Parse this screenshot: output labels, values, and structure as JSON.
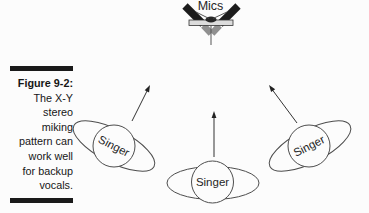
{
  "figure": {
    "caption": {
      "label": "Figure 9-2:",
      "lines": [
        "The X-Y",
        "stereo",
        "miking",
        "pattern can",
        "work well",
        "for backup",
        "vocals."
      ]
    },
    "diagram": {
      "mics_label": "Mics",
      "singers": [
        {
          "label": "Singer",
          "position": "left"
        },
        {
          "label": "Singer",
          "position": "center"
        },
        {
          "label": "Singer",
          "position": "right"
        }
      ]
    },
    "colors": {
      "background": "#fcfcfc",
      "ink": "#1a1a1a",
      "outline": "#4d4d4d",
      "arrow": "#333333",
      "mic_body": "#1c1c1c",
      "mic_capsule": "#909090",
      "stereo_bar": "#dcdcdc",
      "mount": "#262626"
    }
  }
}
